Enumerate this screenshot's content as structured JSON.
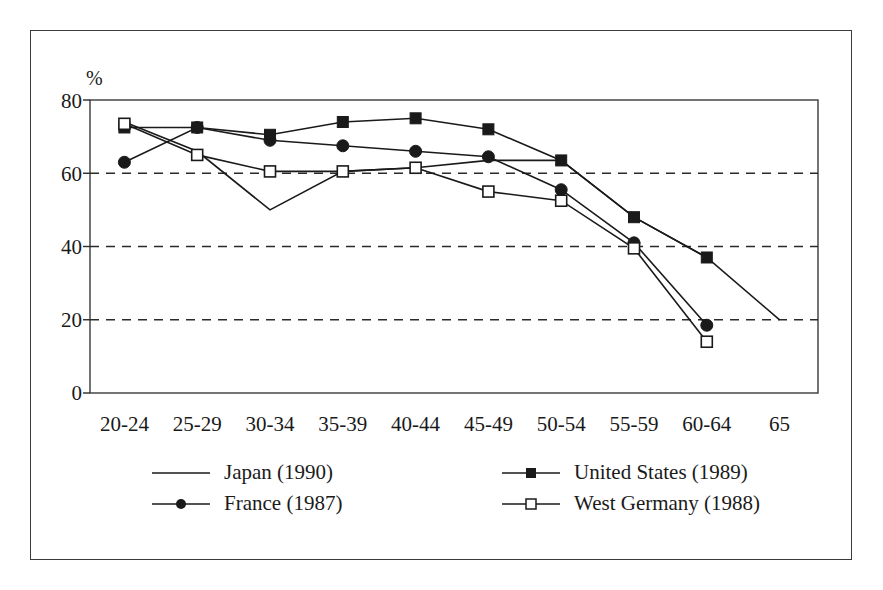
{
  "chart_data": {
    "type": "line",
    "title": "",
    "xlabel": "",
    "ylabel": "%",
    "ylim": [
      0,
      80
    ],
    "yticks": [
      0,
      20,
      40,
      60,
      80
    ],
    "grid": "horizontal dashed at 20, 40, 60",
    "legend_position": "bottom",
    "categories": [
      "20-24",
      "25-29",
      "30-34",
      "35-39",
      "40-44",
      "45-49",
      "50-54",
      "55-59",
      "60-64",
      "65"
    ],
    "series": [
      {
        "name": "Japan (1990)",
        "marker": "none",
        "color": "#1a1a1a",
        "values": [
          74.0,
          66.0,
          50.0,
          60.5,
          61.5,
          63.5,
          63.5,
          48.0,
          37.0,
          20.0
        ]
      },
      {
        "name": "France (1987)",
        "marker": "filled-circle",
        "color": "#1a1a1a",
        "values": [
          63.0,
          72.5,
          69.0,
          67.5,
          66.0,
          64.5,
          55.5,
          41.0,
          18.5,
          null
        ]
      },
      {
        "name": "United States (1989)",
        "marker": "filled-square",
        "color": "#1a1a1a",
        "values": [
          72.5,
          72.5,
          70.5,
          74.0,
          75.0,
          72.0,
          63.5,
          48.0,
          37.0,
          null
        ]
      },
      {
        "name": "West Germany (1988)",
        "marker": "open-square",
        "color": "#1a1a1a",
        "values": [
          73.5,
          65.0,
          60.5,
          60.5,
          61.5,
          55.0,
          52.5,
          39.5,
          14.0,
          null
        ]
      }
    ]
  },
  "legend": {
    "entries": [
      {
        "label": "Japan (1990)",
        "marker": "none"
      },
      {
        "label": "United States (1989)",
        "marker": "filled-square"
      },
      {
        "label": "France (1987)",
        "marker": "filled-circle"
      },
      {
        "label": "West Germany (1988)",
        "marker": "open-square"
      }
    ]
  }
}
